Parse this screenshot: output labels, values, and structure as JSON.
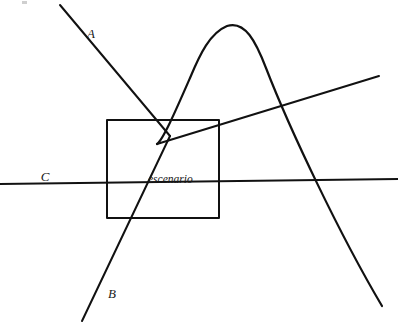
{
  "figure": {
    "background_color": "#ffffff",
    "ink_color": "#111111",
    "width": 398,
    "height": 325,
    "labels": {
      "line_a": "A",
      "line_b": "B",
      "line_c": "C",
      "region": "escenario"
    },
    "label_positions": {
      "line_a": {
        "x": 91,
        "y": 38
      },
      "line_b": {
        "x": 110,
        "y": 298
      },
      "line_c": {
        "x": 42,
        "y": 181
      },
      "region": {
        "x": 148,
        "y": 183
      }
    },
    "shapes": {
      "rectangle": {
        "name": "escenario-rectangle",
        "x": 107,
        "y": 120,
        "width": 112,
        "height": 98,
        "stroke_width": 2
      },
      "line_a": {
        "name": "line-a",
        "x1": 60,
        "y1": 5,
        "x2": 170,
        "y2": 136,
        "stroke_width": 2
      },
      "line_b": {
        "name": "line-b",
        "x1": 170,
        "y1": 136,
        "x2": 82,
        "y2": 321,
        "stroke_width": 2
      },
      "line_c": {
        "name": "line-c",
        "x1": 5,
        "y1": 184,
        "x2": 398,
        "y2": 179,
        "stroke_width": 1.8
      },
      "rising_line": {
        "name": "rising-line",
        "x1": 157,
        "y1": 144,
        "x2": 379,
        "y2": 76,
        "stroke_width": 2
      },
      "curve": {
        "name": "parabolic-curve",
        "start": {
          "x": 157,
          "y": 144
        },
        "apex": {
          "x": 227,
          "y": 26
        },
        "end": {
          "x": 382,
          "y": 306
        },
        "stroke_width": 2.2
      }
    }
  }
}
